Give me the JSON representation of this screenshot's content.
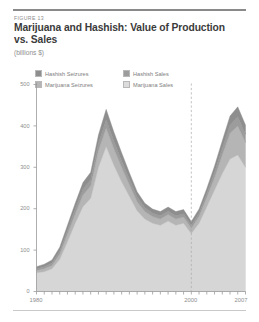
{
  "figure": {
    "number_label": "FIGURE 13",
    "title": "Marijuana and Hashish: Value of Production vs. Sales",
    "units": "(billions $)"
  },
  "colors": {
    "hashish_seizures": "#8e8e8e",
    "marijuana_seizures": "#b5b5b5",
    "hashish_sales": "#9c9c9c",
    "marijuana_sales": "#d6d6d6",
    "axis": "#9a9a9a",
    "text_muted": "#8e8e8e",
    "title": "#3b3b3b",
    "rule": "#8a8a8a",
    "divider_dashed": "#a9a9a9"
  },
  "legend": {
    "items": [
      {
        "label": "Hashish Seizures",
        "color": "#8e8e8e"
      },
      {
        "label": "Hashish Sales",
        "color": "#9c9c9c"
      },
      {
        "label": "Marijuana Seizures",
        "color": "#b5b5b5"
      },
      {
        "label": "Marijuana Sales",
        "color": "#d6d6d6"
      }
    ]
  },
  "chart_data": {
    "type": "area",
    "title": "Marijuana and Hashish: Value of Production vs. Sales",
    "subtitle": "(billions $)",
    "xlabel": "",
    "ylabel": "billions $",
    "stacked": true,
    "grid": false,
    "legend_position": "top-left",
    "xlim": [
      1980,
      2007
    ],
    "ylim": [
      0,
      500
    ],
    "yticks": [
      0,
      100,
      200,
      300,
      400,
      500
    ],
    "ytick_labels": [
      "0",
      "100",
      "200",
      "300",
      "400",
      "500"
    ],
    "xticks": [
      1980,
      1981,
      1982,
      1983,
      1984,
      1985,
      1986,
      1987,
      1988,
      1989,
      1990,
      1991,
      1992,
      1993,
      1994,
      1995,
      1996,
      1997,
      1998,
      1999,
      2000,
      2001,
      2002,
      2003,
      2004,
      2005,
      2006,
      2007
    ],
    "xtick_labels_shown": [
      "1980",
      "2000",
      "2007"
    ],
    "annotations": [
      {
        "type": "vertical-dashed-line",
        "x": 2000,
        "label": ""
      }
    ],
    "x": [
      1980,
      1981,
      1982,
      1983,
      1984,
      1985,
      1986,
      1987,
      1988,
      1989,
      1990,
      1991,
      1992,
      1993,
      1994,
      1995,
      1996,
      1997,
      1998,
      1999,
      2000,
      2001,
      2002,
      2003,
      2004,
      2005,
      2006,
      2007
    ],
    "series": [
      {
        "name": "Marijuana Sales",
        "color": "#d6d6d6",
        "values": [
          45,
          48,
          55,
          78,
          120,
          165,
          205,
          225,
          300,
          350,
          305,
          265,
          230,
          195,
          175,
          165,
          160,
          170,
          160,
          165,
          140,
          165,
          205,
          245,
          285,
          320,
          330,
          300
        ]
      },
      {
        "name": "Marijuana Seizures",
        "color": "#b5b5b5",
        "values": [
          6,
          7,
          8,
          12,
          18,
          22,
          28,
          30,
          40,
          45,
          40,
          35,
          28,
          22,
          18,
          16,
          15,
          16,
          15,
          15,
          13,
          16,
          22,
          30,
          45,
          62,
          70,
          60
        ]
      },
      {
        "name": "Hashish Sales",
        "color": "#9c9c9c",
        "values": [
          4,
          5,
          6,
          8,
          10,
          12,
          14,
          15,
          18,
          20,
          18,
          16,
          13,
          11,
          9,
          8,
          8,
          8,
          8,
          8,
          7,
          8,
          10,
          13,
          16,
          20,
          22,
          20
        ]
      },
      {
        "name": "Hashish Seizures",
        "color": "#8e8e8e",
        "values": [
          5,
          6,
          7,
          9,
          12,
          14,
          16,
          18,
          20,
          25,
          22,
          19,
          16,
          13,
          11,
          10,
          10,
          10,
          10,
          10,
          9,
          10,
          12,
          15,
          18,
          22,
          24,
          22
        ]
      }
    ],
    "totals": [
      60,
      66,
      76,
      107,
      160,
      213,
      263,
      288,
      378,
      440,
      385,
      335,
      287,
      241,
      213,
      199,
      193,
      204,
      193,
      198,
      169,
      199,
      249,
      303,
      364,
      424,
      446,
      402
    ]
  },
  "axes": {
    "x_labels": [
      {
        "value": "1980",
        "x": 1980
      },
      {
        "value": "2000",
        "x": 2000
      },
      {
        "value": "2007",
        "x": 2007
      }
    ],
    "y_labels": [
      "500",
      "400",
      "300",
      "200",
      "100",
      "0"
    ]
  }
}
